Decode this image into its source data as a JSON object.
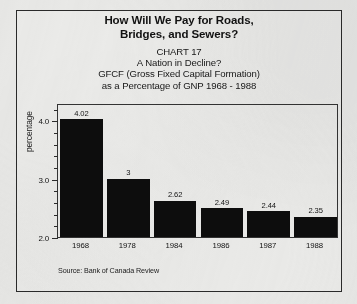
{
  "figure": {
    "main_title_line1": "How Will We Pay for Roads,",
    "main_title_line2": "Bridges, and Sewers?",
    "subtitle_line1": "CHART 17",
    "subtitle_line2": "A Nation in Decline?",
    "subtitle_line3": "GFCF (Gross Fixed Capital Formation)",
    "subtitle_line4": "as a Percentage of GNP 1968 - 1988",
    "source": "Source: Bank of Canada Review"
  },
  "colors": {
    "bar": "#0d0d0d",
    "axis": "#2b2b2b",
    "frame": "#2a2a2a",
    "paper": "#e9e9e7",
    "text": "#141414"
  },
  "chart_data": {
    "type": "bar",
    "title": "How Will We Pay for Roads, Bridges, and Sewers?",
    "subtitle": "CHART 17 — A Nation in Decline? GFCF (Gross Fixed Capital Formation) as a Percentage of GNP 1968 - 1988",
    "xlabel": "",
    "ylabel": "percentage",
    "categories": [
      "1968",
      "1978",
      "1984",
      "1986",
      "1987",
      "1988"
    ],
    "values": [
      4.02,
      3,
      2.62,
      2.49,
      2.44,
      2.35
    ],
    "value_labels": [
      "4.02",
      "3",
      "2.62",
      "2.49",
      "2.44",
      "2.35"
    ],
    "ylim": [
      2.0,
      4.3
    ],
    "ytick_major": [
      "2.0",
      "3.0",
      "4.0"
    ],
    "ytick_major_values": [
      2.0,
      3.0,
      4.0
    ],
    "ytick_minor_values": [
      2.2,
      2.4,
      2.6,
      2.8,
      3.2,
      3.4,
      3.6,
      3.8,
      4.2
    ],
    "grid": false,
    "legend": false,
    "source": "Source: Bank of Canada Review"
  }
}
